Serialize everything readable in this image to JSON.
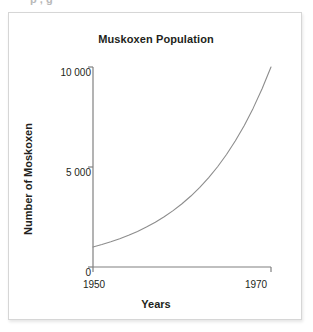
{
  "top_clipped_text": "p , g",
  "figure": {
    "title": "Muskoxen Population"
  },
  "chart_data": {
    "type": "line",
    "title": "Muskoxen Population",
    "xlabel": "Years",
    "ylabel": "Number of Moskoxen",
    "xlim": [
      1950,
      1970
    ],
    "ylim": [
      0,
      10000
    ],
    "xticks": [
      1950,
      1970
    ],
    "xtick_labels": [
      "1950",
      "1970"
    ],
    "yticks": [
      0,
      5000,
      10000
    ],
    "ytick_labels": [
      "0",
      "5 000",
      "10 000"
    ],
    "grid": false,
    "legend": false,
    "line_color": "#8d8d8d",
    "series": [
      {
        "name": "Muskoxen Population",
        "x": [
          1950,
          1951,
          1952,
          1953,
          1954,
          1955,
          1956,
          1957,
          1958,
          1959,
          1960,
          1961,
          1962,
          1963,
          1964,
          1965,
          1966,
          1967,
          1968,
          1969,
          1970
        ],
        "values": [
          1000,
          1122,
          1259,
          1413,
          1585,
          1778,
          1995,
          2239,
          2512,
          2818,
          3162,
          3548,
          3981,
          4467,
          5012,
          5623,
          6310,
          7079,
          7943,
          8913,
          10000
        ]
      }
    ],
    "annotations": []
  },
  "axis_titles": {
    "y": "Number of Moskoxen",
    "x": "Years"
  }
}
